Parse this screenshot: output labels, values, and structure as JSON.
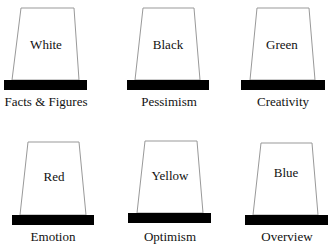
{
  "hats": [
    {
      "color_name": "White",
      "meaning": "Facts & Figures"
    },
    {
      "color_name": "Black",
      "meaning": "Pessimism"
    },
    {
      "color_name": "Green",
      "meaning": "Creativity"
    },
    {
      "color_name": "Red",
      "meaning": "Emotion"
    },
    {
      "color_name": "Yellow",
      "meaning": "Optimism"
    },
    {
      "color_name": "Blue",
      "meaning": "Overview"
    }
  ],
  "colors": {
    "outline": "#999999",
    "brim": "#000000",
    "text": "#111111"
  }
}
